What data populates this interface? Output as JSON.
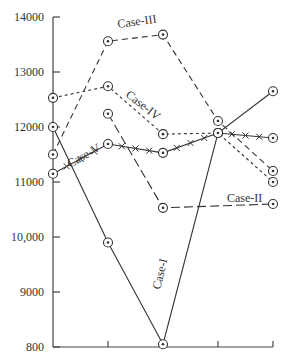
{
  "chart_data": {
    "type": "line",
    "title": "",
    "xlabel": "",
    "ylabel": "",
    "x": [
      0,
      1,
      2,
      3,
      4
    ],
    "y_tick_labels": [
      "14000",
      "13000",
      "12000",
      "11000",
      "10,000",
      "9000",
      "800"
    ],
    "y_ticks": [
      14000,
      13000,
      12000,
      11000,
      10000,
      9000,
      8000
    ],
    "ylim": [
      8000,
      14000
    ],
    "grid": false,
    "legend": "inline labels",
    "series": [
      {
        "name": "Case-I",
        "style": "solid",
        "values": [
          12000,
          9900,
          8050,
          11890,
          12650
        ]
      },
      {
        "name": "Case-II",
        "style": "long-dash",
        "values": [
          null,
          12240,
          10530,
          null,
          10600
        ]
      },
      {
        "name": "Case-III",
        "style": "dashed",
        "values": [
          11500,
          13560,
          13680,
          12110,
          11200
        ]
      },
      {
        "name": "Case-IV",
        "style": "dotted",
        "values": [
          12530,
          12740,
          11870,
          11890,
          11000
        ]
      },
      {
        "name": "Case-V",
        "style": "solid-x",
        "values": [
          11150,
          11690,
          11530,
          11890,
          11800
        ]
      }
    ],
    "labels": {
      "case1": "Case-I",
      "case2": "Case-II",
      "case3": "Case-III",
      "case4": "Case-IV",
      "case5": "Case-V"
    }
  }
}
